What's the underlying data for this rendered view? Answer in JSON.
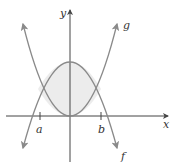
{
  "figure": {
    "axes": {
      "x_label": "x",
      "y_label": "y"
    },
    "ticks": [
      {
        "label": "a",
        "px": 40
      },
      {
        "label": "b",
        "px": 101
      }
    ],
    "curves": [
      {
        "name": "f",
        "label": "f",
        "shape": "downward parabola"
      },
      {
        "name": "g",
        "label": "g",
        "shape": "upward parabola"
      }
    ],
    "region": {
      "description": "shaded area between f (top) and g (bottom) from a to b"
    },
    "colors": {
      "axis": "#444444",
      "curve": "#8a8a8a",
      "shade": "#ececec",
      "text": "#333333"
    }
  }
}
